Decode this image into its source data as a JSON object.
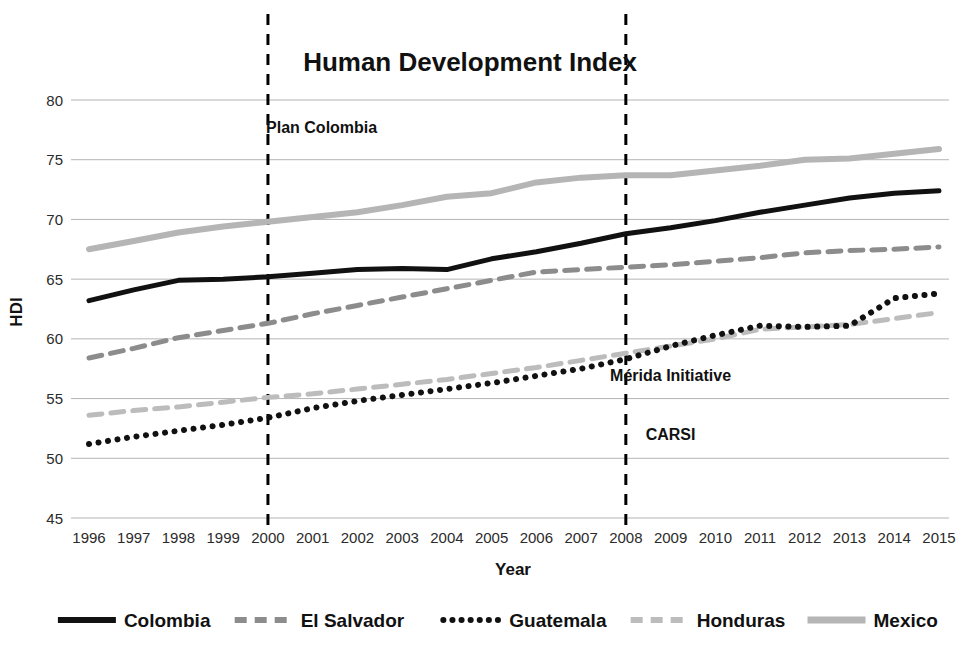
{
  "chart_data": {
    "type": "line",
    "title": "Human Development Index",
    "xlabel": "Year",
    "ylabel": "HDI",
    "ylim": [
      45,
      80
    ],
    "yticks": [
      45,
      50,
      55,
      60,
      65,
      70,
      75,
      80
    ],
    "grid": true,
    "legend_position": "bottom",
    "categories": [
      "1996",
      "1997",
      "1998",
      "1999",
      "2000",
      "2001",
      "2002",
      "2003",
      "2004",
      "2005",
      "2006",
      "2007",
      "2008",
      "2009",
      "2010",
      "2011",
      "2012",
      "2013",
      "2014",
      "2015"
    ],
    "x": [
      1996,
      1997,
      1998,
      1999,
      2000,
      2001,
      2002,
      2003,
      2004,
      2005,
      2006,
      2007,
      2008,
      2009,
      2010,
      2011,
      2012,
      2013,
      2014,
      2015
    ],
    "series": [
      {
        "name": "Colombia",
        "style": "solid",
        "color": "#111111",
        "width": 5,
        "values": [
          63.2,
          64.1,
          64.9,
          65.0,
          65.2,
          65.5,
          65.8,
          65.9,
          65.8,
          66.7,
          67.3,
          68.0,
          68.8,
          69.3,
          69.9,
          70.6,
          71.2,
          71.8,
          72.2,
          72.4
        ]
      },
      {
        "name": "El Salvador",
        "style": "dashed",
        "color": "#8c8c8c",
        "width": 5,
        "values": [
          58.4,
          59.2,
          60.1,
          60.7,
          61.3,
          62.1,
          62.8,
          63.5,
          64.2,
          64.9,
          65.6,
          65.8,
          66.0,
          66.2,
          66.5,
          66.8,
          67.2,
          67.4,
          67.5,
          67.7
        ]
      },
      {
        "name": "Guatemala",
        "style": "dotted",
        "color": "#111111",
        "width": 5,
        "values": [
          51.2,
          51.8,
          52.3,
          52.8,
          53.4,
          54.2,
          54.8,
          55.3,
          55.8,
          56.3,
          56.9,
          57.5,
          58.3,
          59.4,
          60.3,
          61.1,
          61.0,
          61.1,
          63.4,
          63.8
        ]
      },
      {
        "name": "Honduras",
        "style": "dashed",
        "color": "#bcbcbc",
        "width": 5,
        "values": [
          53.6,
          54.0,
          54.3,
          54.7,
          55.1,
          55.4,
          55.8,
          56.2,
          56.6,
          57.1,
          57.6,
          58.2,
          58.8,
          59.4,
          60.0,
          60.8,
          61.0,
          61.2,
          61.7,
          62.2
        ]
      },
      {
        "name": "Mexico",
        "style": "solid",
        "color": "#b5b5b5",
        "width": 6,
        "values": [
          67.5,
          68.2,
          68.9,
          69.4,
          69.8,
          70.2,
          70.6,
          71.2,
          71.9,
          72.2,
          73.1,
          73.5,
          73.7,
          73.7,
          74.1,
          74.5,
          75.0,
          75.1,
          75.5,
          75.9
        ]
      }
    ],
    "annotations": [
      {
        "label": "Plan Colombia",
        "x": 2001.2,
        "y": 77.2
      },
      {
        "label": "Mérida Initiative",
        "x": 2009.0,
        "y": 56.5
      },
      {
        "label": "CARSI",
        "x": 2009.0,
        "y": 51.5
      }
    ],
    "event_lines": [
      {
        "label": "2000",
        "x": 2000
      },
      {
        "label": "2008",
        "x": 2008
      }
    ]
  }
}
